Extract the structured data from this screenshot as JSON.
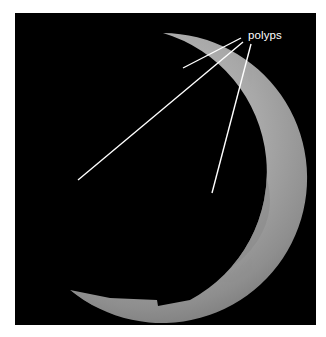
{
  "figure": {
    "annotation": {
      "label": "polyps",
      "pointer_count": 3,
      "targets": [
        "upper polyp near top rim",
        "left polyp on fold",
        "right polyp on fold"
      ]
    },
    "colors": {
      "frame_background": "#000000",
      "page_background": "#ffffff",
      "annotation_color": "#ffffff"
    }
  }
}
